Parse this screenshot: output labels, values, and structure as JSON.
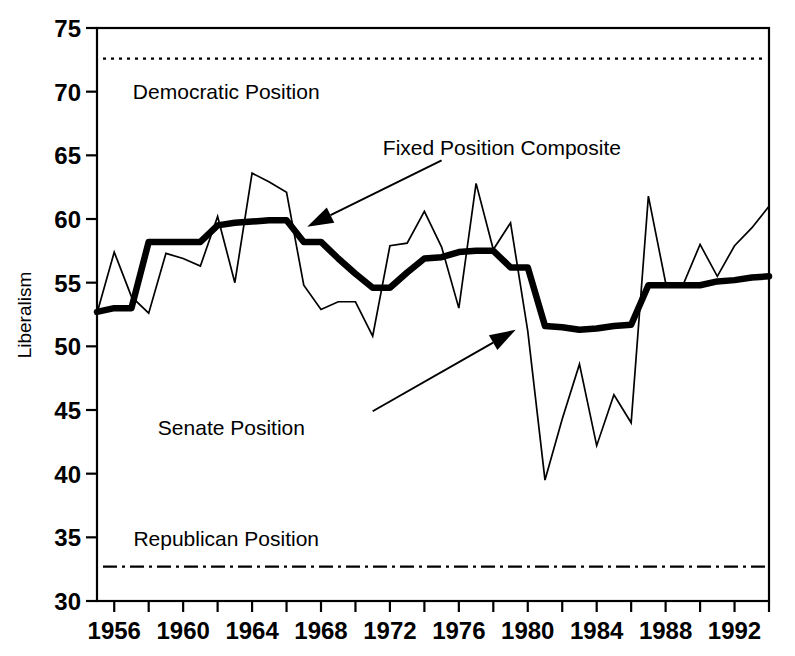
{
  "chart_data": {
    "type": "line",
    "title": "",
    "xlabel": "",
    "ylabel": "Liberalism",
    "xlim": [
      1955,
      1994
    ],
    "ylim": [
      30,
      75
    ],
    "y_ticks": [
      30,
      35,
      40,
      45,
      50,
      55,
      60,
      65,
      70,
      75
    ],
    "x_ticks": [
      1956,
      1958,
      1960,
      1962,
      1964,
      1966,
      1968,
      1970,
      1972,
      1974,
      1976,
      1978,
      1980,
      1982,
      1984,
      1986,
      1988,
      1990,
      1992,
      1994
    ],
    "x_tick_labels": [
      "1956",
      "",
      "1960",
      "",
      "1964",
      "",
      "1968",
      "",
      "1972",
      "",
      "1976",
      "",
      "1980",
      "",
      "1984",
      "",
      "1988",
      "",
      "1992",
      ""
    ],
    "grid": false,
    "legend_position": "inline-annotations",
    "x": [
      1955,
      1956,
      1957,
      1958,
      1959,
      1960,
      1961,
      1962,
      1963,
      1964,
      1965,
      1966,
      1967,
      1968,
      1969,
      1970,
      1971,
      1972,
      1973,
      1974,
      1975,
      1976,
      1977,
      1978,
      1979,
      1980,
      1981,
      1982,
      1983,
      1984,
      1985,
      1986,
      1987,
      1988,
      1989,
      1990,
      1991,
      1992,
      1993,
      1994
    ],
    "series": [
      {
        "name": "Senate Position",
        "style": "thin-solid",
        "values": [
          52.6,
          57.4,
          53.9,
          52.6,
          57.3,
          56.9,
          56.3,
          60.2,
          55.0,
          63.6,
          62.9,
          62.1,
          54.8,
          52.9,
          53.5,
          53.5,
          50.8,
          57.9,
          58.1,
          60.6,
          57.8,
          53.0,
          62.8,
          57.6,
          59.7,
          51.2,
          39.5,
          44.3,
          48.6,
          42.2,
          46.2,
          44.0,
          61.8,
          55.0,
          54.8,
          58.0,
          55.5,
          57.9,
          59.3,
          61.0
        ]
      },
      {
        "name": "Fixed Position Composite",
        "style": "thick-solid",
        "values": [
          52.7,
          53.0,
          53.0,
          58.2,
          58.2,
          58.2,
          58.2,
          59.5,
          59.7,
          59.8,
          59.9,
          59.9,
          58.2,
          58.2,
          56.9,
          55.7,
          54.6,
          54.6,
          55.8,
          56.9,
          57.0,
          57.4,
          57.5,
          57.5,
          56.2,
          56.2,
          51.6,
          51.5,
          51.3,
          51.4,
          51.6,
          51.7,
          54.8,
          54.8,
          54.8,
          54.8,
          55.1,
          55.2,
          55.4,
          55.5
        ]
      }
    ],
    "reference_lines": [
      {
        "name": "Democratic Position",
        "label": "Democratic Position",
        "value": 72.6,
        "style": "dotted"
      },
      {
        "name": "Republican Position",
        "label": "Republican Position",
        "value": 32.7,
        "style": "dash-dot"
      }
    ],
    "annotations": [
      {
        "name": "fixed-position-composite",
        "label": "Fixed Position Composite",
        "text_x": 1978.5,
        "text_y": 65.6,
        "arrow_from_x": 1975.0,
        "arrow_from_y": 64.6,
        "arrow_to_x": 1967.2,
        "arrow_to_y": 59.4
      },
      {
        "name": "senate-position",
        "label": "Senate Position",
        "text_x": 1962.8,
        "text_y": 43.6,
        "arrow_from_x": 1971.0,
        "arrow_from_y": 44.9,
        "arrow_to_x": 1979.3,
        "arrow_to_y": 51.3
      }
    ],
    "colors": {
      "line": "#000000",
      "axis": "#000000",
      "background": "#ffffff"
    }
  }
}
